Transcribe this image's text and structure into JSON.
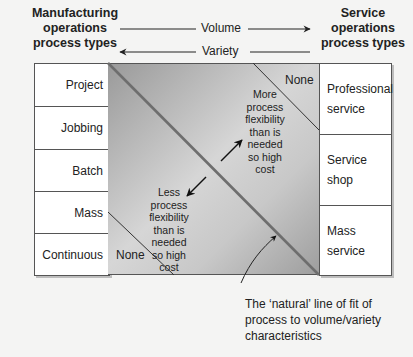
{
  "headers": {
    "left": [
      "Manufacturing",
      "operations",
      "process types"
    ],
    "right": [
      "Service",
      "operations",
      "process types"
    ]
  },
  "axes": {
    "volume": "Volume",
    "variety": "Variety",
    "volume_direction": "right",
    "variety_direction": "left"
  },
  "manufacturing_types": [
    "Project",
    "Jobbing",
    "Batch",
    "Mass",
    "Continuous"
  ],
  "service_types": [
    [
      "Professional",
      "service"
    ],
    [
      "Service",
      "shop"
    ],
    [
      "Mass",
      "service"
    ]
  ],
  "regions": {
    "top_right_none": "None",
    "bottom_left_none": "None",
    "upper_note": [
      "More",
      "process",
      "flexibility",
      "than is",
      "needed",
      "so high",
      "cost"
    ],
    "lower_note": [
      "Less",
      "process",
      "flexibility",
      "than is",
      "needed",
      "so high",
      "cost"
    ]
  },
  "caption": [
    "The ‘natural’ line of fit of",
    "process to volume/variety",
    "characteristics"
  ],
  "colors": {
    "panel_dark": "#9a9a9a",
    "panel_light": "#d6d6d6",
    "line": "#555555",
    "background": "#f4f4f3"
  }
}
